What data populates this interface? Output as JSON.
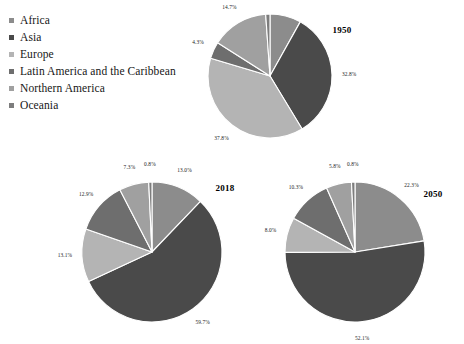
{
  "figure": {
    "background": "#ffffff",
    "label_color": "#1c1c1c",
    "slice_border_color": "#ffffff"
  },
  "legend": {
    "position": "top-left",
    "items": [
      {
        "label": "Africa",
        "color": "#8c8c8c",
        "marker": "square-marker"
      },
      {
        "label": "Asia",
        "color": "#4a4a4a",
        "marker": "square-marker"
      },
      {
        "label": "Europe",
        "color": "#b4b4b4",
        "marker": "square-marker"
      },
      {
        "label": "Latin America and the Caribbean",
        "color": "#6e6e6e",
        "marker": "square-marker"
      },
      {
        "label": "Northern America",
        "color": "#a0a0a0",
        "marker": "square-marker"
      },
      {
        "label": "Oceania",
        "color": "#7d7d7d",
        "marker": "square-marker"
      }
    ]
  },
  "chart_data": [
    {
      "type": "pie",
      "title": "1950",
      "categories": [
        "Africa",
        "Asia",
        "Europe",
        "Latin America and the Caribbean",
        "Northern America",
        "Oceania"
      ],
      "values": [
        8.0,
        32.8,
        37.8,
        4.3,
        14.7,
        1.1
      ],
      "labels": [
        "8.0%",
        "32.8%",
        "37.8%",
        "4.3%",
        "14.7%",
        "1.1%"
      ],
      "colors": [
        "#8c8c8c",
        "#4a4a4a",
        "#b4b4b4",
        "#6e6e6e",
        "#a0a0a0",
        "#7d7d7d"
      ],
      "start_angle_deg": -90,
      "direction": "clockwise",
      "units": "percent",
      "legend": "shared"
    },
    {
      "type": "pie",
      "title": "2018",
      "categories": [
        "Africa",
        "Asia",
        "Europe",
        "Latin America and the Caribbean",
        "Northern America",
        "Oceania"
      ],
      "values": [
        13.0,
        59.7,
        13.1,
        12.9,
        7.3,
        0.8
      ],
      "labels": [
        "13.0%",
        "59.7%",
        "13.1%",
        "12.9%",
        "7.3%",
        "0.8%"
      ],
      "colors": [
        "#8c8c8c",
        "#4a4a4a",
        "#b4b4b4",
        "#6e6e6e",
        "#a0a0a0",
        "#7d7d7d"
      ],
      "start_angle_deg": -90,
      "direction": "clockwise",
      "units": "percent",
      "legend": "shared"
    },
    {
      "type": "pie",
      "title": "2050",
      "categories": [
        "Africa",
        "Asia",
        "Europe",
        "Latin America and the Caribbean",
        "Northern America",
        "Oceania"
      ],
      "values": [
        22.3,
        52.1,
        8.0,
        10.3,
        5.8,
        0.8
      ],
      "labels": [
        "22.3%",
        "52.1%",
        "8.0%",
        "10.3%",
        "5.8%",
        "0.8%"
      ],
      "colors": [
        "#8c8c8c",
        "#4a4a4a",
        "#b4b4b4",
        "#6e6e6e",
        "#a0a0a0",
        "#7d7d7d"
      ],
      "start_angle_deg": -90,
      "direction": "clockwise",
      "units": "percent",
      "legend": "shared"
    }
  ],
  "layout": {
    "pies": [
      {
        "title": "1950",
        "cx": 270,
        "cy": 76,
        "r": 62,
        "label_r_factor": 1.18,
        "year_dx": 72,
        "year_dy": -46
      },
      {
        "title": "2018",
        "cx": 152,
        "cy": 252,
        "r": 70,
        "label_r_factor": 1.16,
        "year_dx": 73,
        "year_dy": -64
      },
      {
        "title": "2050",
        "cx": 355,
        "cy": 252,
        "r": 70,
        "label_r_factor": 1.16,
        "year_dx": 78,
        "year_dy": -58
      }
    ]
  }
}
